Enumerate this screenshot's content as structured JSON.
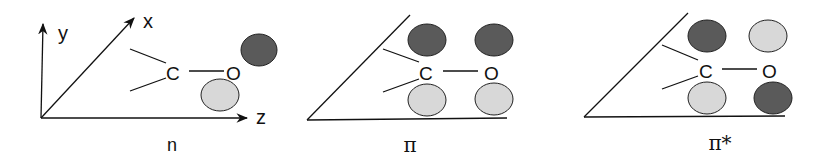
{
  "colors": {
    "dark_lobe": "#5a5a5a",
    "light_lobe": "#d8d8d8",
    "line": "#111111",
    "background": "#ffffff"
  },
  "panels": [
    {
      "id": "n",
      "caption": "n",
      "axes": {
        "x": "x",
        "y": "y",
        "z": "z"
      },
      "atoms": {
        "carbon": "C",
        "oxygen": "O"
      },
      "lobes": [
        {
          "position": "upper-right of O",
          "shade": "dark"
        },
        {
          "position": "lower-left of O",
          "shade": "light"
        }
      ]
    },
    {
      "id": "pi",
      "caption": "π",
      "atoms": {
        "carbon": "C",
        "oxygen": "O"
      },
      "lobes": [
        {
          "position": "above C",
          "shade": "dark"
        },
        {
          "position": "below C",
          "shade": "light"
        },
        {
          "position": "above O",
          "shade": "dark"
        },
        {
          "position": "below O",
          "shade": "light"
        }
      ]
    },
    {
      "id": "pi-star",
      "caption": "π*",
      "atoms": {
        "carbon": "C",
        "oxygen": "O"
      },
      "lobes": [
        {
          "position": "above C",
          "shade": "dark"
        },
        {
          "position": "below C",
          "shade": "light"
        },
        {
          "position": "above O",
          "shade": "light"
        },
        {
          "position": "below O",
          "shade": "dark"
        }
      ]
    }
  ]
}
